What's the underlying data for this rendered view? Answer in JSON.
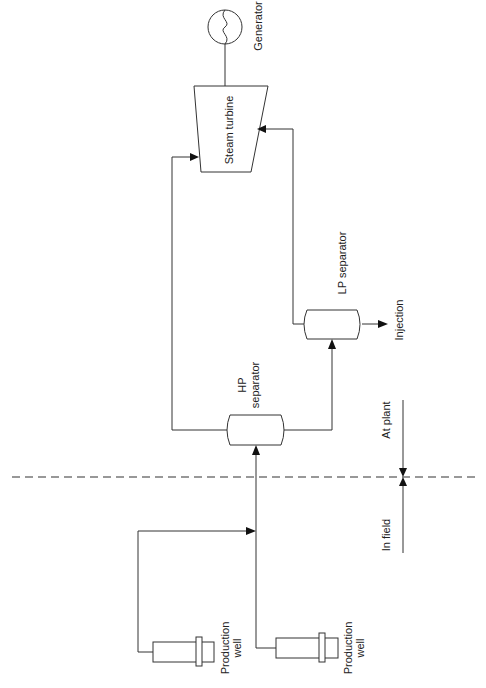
{
  "diagram": {
    "labels": {
      "generator": "Generator",
      "steam_turbine": "Steam turbine",
      "lp_separator": "LP separator",
      "injection": "Injection",
      "hp_separator_line1": "HP",
      "hp_separator_line2": "separator",
      "at_plant": "At plant",
      "in_field": "In field",
      "production_well_1_line1": "Production",
      "production_well_1_line2": "well",
      "production_well_2_line1": "Production",
      "production_well_2_line2": "well"
    },
    "nodes": [
      {
        "id": "generator",
        "type": "generator-circle"
      },
      {
        "id": "steam_turbine",
        "type": "trapezoid"
      },
      {
        "id": "hp_separator",
        "type": "vessel"
      },
      {
        "id": "lp_separator",
        "type": "vessel"
      },
      {
        "id": "production_well_1",
        "type": "wellhead"
      },
      {
        "id": "production_well_2",
        "type": "wellhead"
      }
    ],
    "edges": [
      {
        "from": "production_well_1",
        "to": "junction"
      },
      {
        "from": "production_well_2",
        "to": "hp_separator"
      },
      {
        "from": "hp_separator",
        "to": "steam_turbine",
        "note": "HP steam"
      },
      {
        "from": "hp_separator",
        "to": "lp_separator",
        "note": "brine"
      },
      {
        "from": "lp_separator",
        "to": "steam_turbine",
        "note": "LP steam"
      },
      {
        "from": "lp_separator",
        "to": "injection"
      },
      {
        "from": "steam_turbine",
        "to": "generator"
      }
    ],
    "boundary": {
      "style": "dashed",
      "above": "At plant",
      "below": "In field"
    },
    "colors": {
      "line": "#333333",
      "arrow": "#111111",
      "background": "#ffffff"
    }
  }
}
